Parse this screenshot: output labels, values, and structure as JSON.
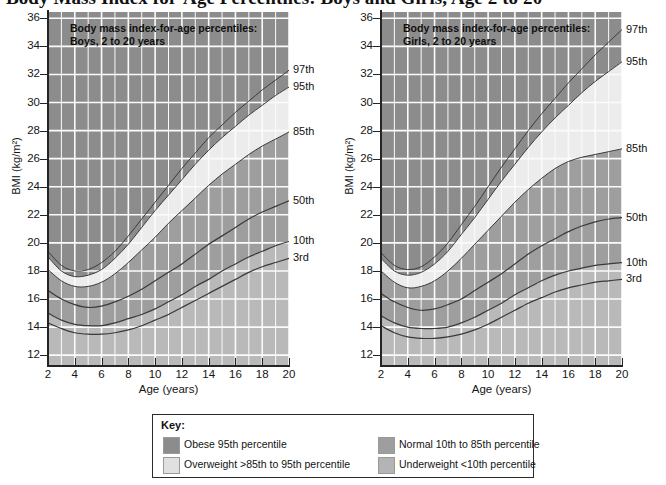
{
  "title": "Body Mass Index for-Age Percentiles: Boys and Girls, Age 2 to 20",
  "axis": {
    "y_title": "BMI (kg/m²)",
    "x_title": "Age (years)",
    "y_ticks": [
      12,
      14,
      16,
      18,
      20,
      22,
      24,
      26,
      28,
      30,
      32,
      34,
      36
    ],
    "x_ticks": [
      2,
      4,
      6,
      8,
      10,
      12,
      14,
      16,
      18,
      20
    ]
  },
  "charts": [
    {
      "id": "boys",
      "heading_line1": "Body mass index-for-age percentiles:",
      "heading_line2": "Boys, 2 to 20 years",
      "curve_labels": [
        "97th",
        "95th",
        "85th",
        "50th",
        "10th",
        "3rd"
      ]
    },
    {
      "id": "girls",
      "heading_line1": "Body mass index-for-age percentiles:",
      "heading_line2": "Girls, 2 to 20 years",
      "curve_labels": [
        "97th",
        "95th",
        "85th",
        "50th",
        "10th",
        "3rd"
      ]
    }
  ],
  "key": {
    "title": "Key:",
    "items": [
      {
        "label": "Obese 95th percentile",
        "color": "#8c8c8c"
      },
      {
        "label": "Overweight >85th  to 95th percentile",
        "color": "#e0e0e0"
      },
      {
        "label": "Normal 10th to 85th percentile",
        "color": "#9e9e9e"
      },
      {
        "label": "Underweight <10th percentile",
        "color": "#b4b4b4"
      }
    ]
  },
  "colors": {
    "plot_background": "#e3e3e3",
    "gridline": "#fbfbfb",
    "axis": "#242424",
    "obese": "#8c8c8c",
    "overweight": "#ececec",
    "normal": "#9e9e9e",
    "underweight": "#b9b9b9",
    "curve_line": "#3a3a3a"
  },
  "chart_data": {
    "type": "line",
    "title": "Body Mass Index for-Age Percentiles: Boys and Girls, Age 2 to 20",
    "xlabel": "Age (years)",
    "ylabel": "BMI (kg/m²)",
    "xlim": [
      2,
      20
    ],
    "ylim": [
      11,
      36
    ],
    "grid": true,
    "legend": "below-plots",
    "panels": [
      {
        "name": "Boys, 2 to 20 years",
        "x": [
          2,
          3,
          4,
          5,
          6,
          7,
          8,
          9,
          10,
          11,
          12,
          13,
          14,
          15,
          16,
          17,
          18,
          19,
          20
        ],
        "series": [
          {
            "name": "97th",
            "values": [
              19.4,
              18.4,
              18.0,
              18.1,
              18.6,
              19.4,
              20.5,
              21.7,
              22.9,
              24.1,
              25.3,
              26.4,
              27.5,
              28.4,
              29.3,
              30.1,
              30.9,
              31.6,
              32.3
            ]
          },
          {
            "name": "95th",
            "values": [
              19.0,
              18.0,
              17.6,
              17.7,
              18.1,
              18.9,
              19.9,
              21.1,
              22.3,
              23.4,
              24.5,
              25.6,
              26.6,
              27.5,
              28.3,
              29.1,
              29.8,
              30.5,
              31.1
            ]
          },
          {
            "name": "85th",
            "values": [
              18.1,
              17.3,
              16.9,
              16.9,
              17.2,
              17.8,
              18.6,
              19.5,
              20.4,
              21.4,
              22.3,
              23.2,
              24.1,
              24.9,
              25.6,
              26.3,
              26.9,
              27.4,
              27.9
            ]
          },
          {
            "name": "50th",
            "values": [
              16.6,
              16.0,
              15.6,
              15.4,
              15.5,
              15.8,
              16.2,
              16.7,
              17.3,
              17.9,
              18.5,
              19.2,
              19.9,
              20.5,
              21.1,
              21.7,
              22.2,
              22.6,
              23.0
            ]
          },
          {
            "name": "10th",
            "values": [
              15.0,
              14.5,
              14.2,
              14.1,
              14.1,
              14.3,
              14.6,
              14.9,
              15.3,
              15.8,
              16.3,
              16.9,
              17.4,
              18.0,
              18.5,
              19.0,
              19.4,
              19.8,
              20.1
            ]
          },
          {
            "name": "3rd",
            "values": [
              14.3,
              13.9,
              13.6,
              13.5,
              13.5,
              13.6,
              13.8,
              14.1,
              14.5,
              14.9,
              15.4,
              15.9,
              16.4,
              16.9,
              17.4,
              17.9,
              18.3,
              18.6,
              18.9
            ]
          }
        ]
      },
      {
        "name": "Girls, 2 to 20 years",
        "x": [
          2,
          3,
          4,
          5,
          6,
          7,
          8,
          9,
          10,
          11,
          12,
          13,
          14,
          15,
          16,
          17,
          18,
          19,
          20
        ],
        "series": [
          {
            "name": "97th",
            "values": [
              19.3,
              18.4,
              18.1,
              18.3,
              19.0,
              20.0,
              21.3,
              22.6,
              24.0,
              25.4,
              26.7,
              28.0,
              29.2,
              30.3,
              31.4,
              32.4,
              33.4,
              34.3,
              35.2
            ]
          },
          {
            "name": "95th",
            "values": [
              18.9,
              18.0,
              17.7,
              17.9,
              18.5,
              19.4,
              20.6,
              21.8,
              23.1,
              24.4,
              25.6,
              26.8,
              27.9,
              28.9,
              29.8,
              30.7,
              31.5,
              32.2,
              32.9
            ]
          },
          {
            "name": "85th",
            "values": [
              18.0,
              17.2,
              16.8,
              16.9,
              17.3,
              18.0,
              18.9,
              19.9,
              20.9,
              21.9,
              22.9,
              23.8,
              24.6,
              25.3,
              25.8,
              26.1,
              26.3,
              26.5,
              26.7
            ]
          },
          {
            "name": "50th",
            "values": [
              16.4,
              15.8,
              15.4,
              15.2,
              15.3,
              15.6,
              16.0,
              16.6,
              17.2,
              17.8,
              18.5,
              19.2,
              19.8,
              20.3,
              20.8,
              21.2,
              21.5,
              21.7,
              21.8
            ]
          },
          {
            "name": "10th",
            "values": [
              14.8,
              14.3,
              14.0,
              13.9,
              13.9,
              14.0,
              14.3,
              14.7,
              15.2,
              15.7,
              16.3,
              16.8,
              17.3,
              17.7,
              18.0,
              18.2,
              18.4,
              18.5,
              18.6
            ]
          },
          {
            "name": "3rd",
            "values": [
              14.1,
              13.6,
              13.3,
              13.2,
              13.2,
              13.3,
              13.5,
              13.8,
              14.2,
              14.7,
              15.2,
              15.7,
              16.1,
              16.5,
              16.8,
              17.0,
              17.2,
              17.3,
              17.4
            ]
          }
        ]
      }
    ]
  }
}
